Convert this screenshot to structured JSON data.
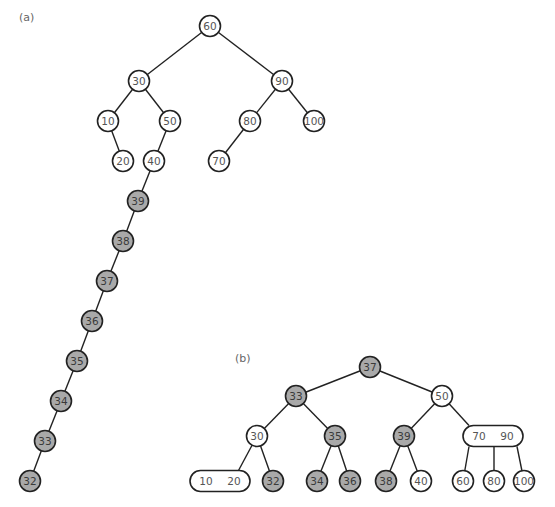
{
  "diagram": {
    "panels": [
      {
        "id": "a",
        "label": "(a)",
        "description": "Unbalanced binary search tree after sequential insertions",
        "nodes": [
          {
            "id": "a60",
            "value": "60",
            "shaded": false
          },
          {
            "id": "a30",
            "value": "30",
            "shaded": false
          },
          {
            "id": "a90",
            "value": "90",
            "shaded": false
          },
          {
            "id": "a10",
            "value": "10",
            "shaded": false
          },
          {
            "id": "a50",
            "value": "50",
            "shaded": false
          },
          {
            "id": "a80",
            "value": "80",
            "shaded": false
          },
          {
            "id": "a100",
            "value": "100",
            "shaded": false
          },
          {
            "id": "a20",
            "value": "20",
            "shaded": false
          },
          {
            "id": "a40",
            "value": "40",
            "shaded": false
          },
          {
            "id": "a70",
            "value": "70",
            "shaded": false
          },
          {
            "id": "a39",
            "value": "39",
            "shaded": true
          },
          {
            "id": "a38",
            "value": "38",
            "shaded": true
          },
          {
            "id": "a37",
            "value": "37",
            "shaded": true
          },
          {
            "id": "a36",
            "value": "36",
            "shaded": true
          },
          {
            "id": "a35",
            "value": "35",
            "shaded": true
          },
          {
            "id": "a34",
            "value": "34",
            "shaded": true
          },
          {
            "id": "a33",
            "value": "33",
            "shaded": true
          },
          {
            "id": "a32",
            "value": "32",
            "shaded": true
          }
        ],
        "edges": [
          [
            "a60",
            "a30"
          ],
          [
            "a60",
            "a90"
          ],
          [
            "a30",
            "a10"
          ],
          [
            "a30",
            "a50"
          ],
          [
            "a90",
            "a80"
          ],
          [
            "a90",
            "a100"
          ],
          [
            "a10",
            "a20"
          ],
          [
            "a50",
            "a40"
          ],
          [
            "a80",
            "a70"
          ],
          [
            "a40",
            "a39"
          ],
          [
            "a39",
            "a38"
          ],
          [
            "a38",
            "a37"
          ],
          [
            "a37",
            "a36"
          ],
          [
            "a36",
            "a35"
          ],
          [
            "a35",
            "a34"
          ],
          [
            "a34",
            "a33"
          ],
          [
            "a33",
            "a32"
          ]
        ]
      },
      {
        "id": "b",
        "label": "(b)",
        "description": "Balanced 2-3 tree containing the same values",
        "nodes": [
          {
            "id": "b37",
            "values": [
              "37"
            ],
            "shaded": true
          },
          {
            "id": "b33",
            "values": [
              "33"
            ],
            "shaded": true
          },
          {
            "id": "b50",
            "values": [
              "50"
            ],
            "shaded": false
          },
          {
            "id": "b30",
            "values": [
              "30"
            ],
            "shaded": false
          },
          {
            "id": "b35",
            "values": [
              "35"
            ],
            "shaded": true
          },
          {
            "id": "b39",
            "values": [
              "39"
            ],
            "shaded": true
          },
          {
            "id": "b7090",
            "values": [
              "70",
              "90"
            ],
            "shaded": false
          },
          {
            "id": "b1020",
            "values": [
              "10",
              "20"
            ],
            "shaded": false
          },
          {
            "id": "b32",
            "values": [
              "32"
            ],
            "shaded": true
          },
          {
            "id": "b34",
            "values": [
              "34"
            ],
            "shaded": true
          },
          {
            "id": "b36",
            "values": [
              "36"
            ],
            "shaded": true
          },
          {
            "id": "b38",
            "values": [
              "38"
            ],
            "shaded": true
          },
          {
            "id": "b40",
            "values": [
              "40"
            ],
            "shaded": false
          },
          {
            "id": "b60",
            "values": [
              "60"
            ],
            "shaded": false
          },
          {
            "id": "b80",
            "values": [
              "80"
            ],
            "shaded": false
          },
          {
            "id": "b100",
            "values": [
              "100"
            ],
            "shaded": false
          }
        ],
        "edges": [
          [
            "b37",
            "b33"
          ],
          [
            "b37",
            "b50"
          ],
          [
            "b33",
            "b30"
          ],
          [
            "b33",
            "b35"
          ],
          [
            "b50",
            "b39"
          ],
          [
            "b50",
            "b7090"
          ],
          [
            "b30",
            "b1020"
          ],
          [
            "b30",
            "b32"
          ],
          [
            "b35",
            "b34"
          ],
          [
            "b35",
            "b36"
          ],
          [
            "b39",
            "b38"
          ],
          [
            "b39",
            "b40"
          ],
          [
            "b7090",
            "b60"
          ],
          [
            "b7090",
            "b80"
          ],
          [
            "b7090",
            "b100"
          ]
        ]
      }
    ],
    "colors": {
      "shaded_fill": "#a9a9a9",
      "white_fill": "#ffffff",
      "stroke": "#222222",
      "text": "#555555"
    }
  }
}
